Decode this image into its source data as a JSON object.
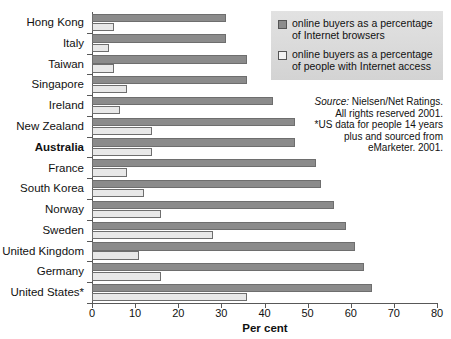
{
  "chart_data": {
    "type": "bar",
    "orientation": "horizontal",
    "title": "",
    "xlabel": "Per cent",
    "ylabel": "",
    "xlim": [
      0,
      80
    ],
    "xticks": [
      0,
      10,
      20,
      30,
      40,
      50,
      60,
      70,
      80
    ],
    "grid": false,
    "legend_position": "top-right",
    "categories": [
      "Hong Kong",
      "Italy",
      "Taiwan",
      "Singapore",
      "Ireland",
      "New Zealand",
      "Australia",
      "France",
      "South Korea",
      "Norway",
      "Sweden",
      "United Kingdom",
      "Germany",
      "United States*"
    ],
    "highlight_category": "Australia",
    "series": [
      {
        "name": "online buyers as a percentage of Internet browsers",
        "color": "#8b8b8b",
        "values": [
          31,
          31,
          36,
          36,
          42,
          47,
          47,
          52,
          53,
          56,
          59,
          61,
          63,
          65
        ]
      },
      {
        "name": "online buyers as a percentage of people with Internet access",
        "color": "#e8e8e8",
        "values": [
          5,
          4,
          5,
          8,
          6.5,
          14,
          14,
          8,
          12,
          16,
          28,
          11,
          16,
          36
        ]
      }
    ]
  },
  "legend": {
    "items": [
      {
        "swatch": "dark",
        "line1": "online buyers as a percentage",
        "line2": "of Internet browsers"
      },
      {
        "swatch": "light",
        "line1": "online buyers as a percentage",
        "line2": "of people with Internet access"
      }
    ]
  },
  "source_note": {
    "label": "Source:",
    "line1": "Nielsen/Net Ratings.",
    "line2": "All rights reserved 2001.",
    "line3": "*US data for people 14 years",
    "line4": "plus and sourced from",
    "line5": "eMarketer. 2001."
  }
}
